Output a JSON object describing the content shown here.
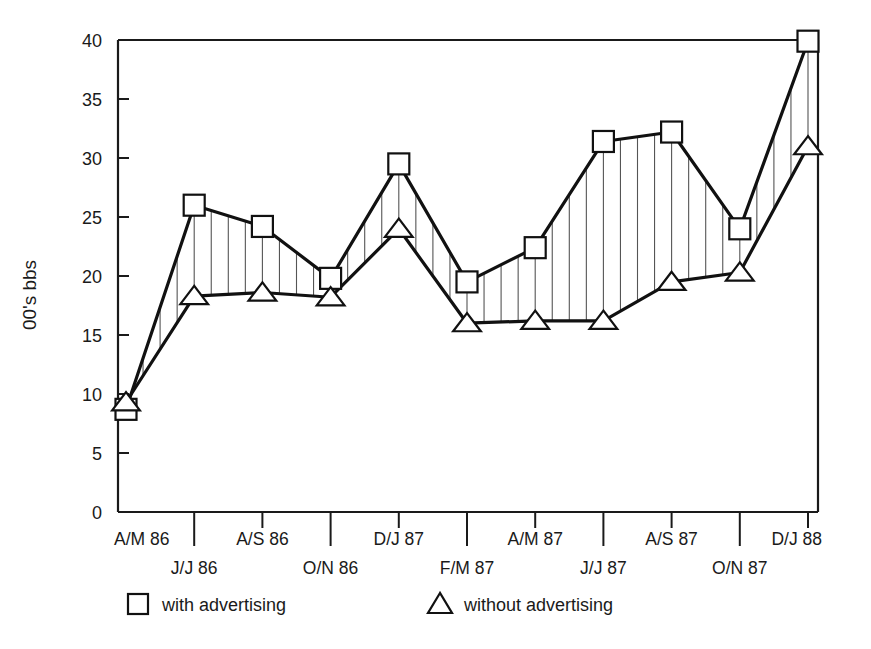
{
  "chart_data": {
    "type": "line",
    "title": "",
    "xlabel": "",
    "ylabel": "00's bbs",
    "ylim": [
      0,
      40
    ],
    "ytick_values": [
      0,
      5,
      10,
      15,
      20,
      25,
      30,
      35,
      40
    ],
    "ytick_labels": [
      "0",
      "5",
      "10",
      "15",
      "20",
      "25",
      "30",
      "35",
      "40"
    ],
    "grid": false,
    "legend_position": "below-axes",
    "categories": [
      "A/M 86",
      "J/J 86",
      "A/S 86",
      "O/N 86",
      "D/J 87",
      "F/M 87",
      "A/M 87",
      "J/J 87",
      "A/S 87",
      "O/N 87",
      "D/J 88"
    ],
    "series": [
      {
        "name": "with advertising",
        "marker": "square",
        "values": [
          8.7,
          26.0,
          24.2,
          19.8,
          29.5,
          19.5,
          22.4,
          31.4,
          32.2,
          24.0,
          39.9
        ]
      },
      {
        "name": "without advertising",
        "marker": "triangle",
        "values": [
          9.3,
          18.3,
          18.6,
          18.2,
          24.0,
          16.0,
          16.2,
          16.2,
          19.5,
          20.3,
          31.0
        ]
      }
    ],
    "vertical_connectors": true
  },
  "axes": {
    "y_axis_title": "00's bbs"
  },
  "legend": {
    "items": [
      {
        "marker": "square-marker-icon",
        "label": "with advertising"
      },
      {
        "marker": "triangle-marker-icon",
        "label": "without advertising"
      }
    ]
  },
  "colors": {
    "line": "#111111",
    "marker_fill": "#ffffff",
    "axis": "#1a1a1a",
    "connector": "#555555",
    "background": "#ffffff"
  }
}
